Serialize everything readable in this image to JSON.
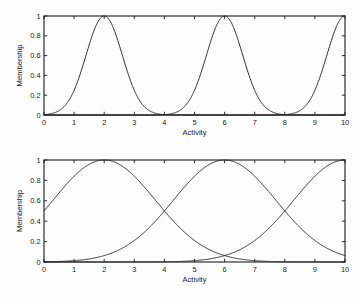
{
  "figure": {
    "background_color": "#fdfdfd",
    "axis_color": "#1a1a1a",
    "curve_color": "#2b2b2b",
    "panel_count": 2
  },
  "chart_data": [
    {
      "type": "line",
      "title": "",
      "subtitle": "",
      "panel": "top",
      "xlabel": "Activity",
      "ylabel": "Membership",
      "xlim": [
        0,
        10
      ],
      "ylim": [
        0,
        1
      ],
      "xticks": [
        0,
        1,
        2,
        3,
        4,
        5,
        6,
        7,
        8,
        9,
        10
      ],
      "xticklabels": [
        "0",
        "1",
        "2",
        "3",
        "4",
        "5",
        "6",
        "7",
        "8",
        "9",
        "10"
      ],
      "yticks": [
        0,
        0.2,
        0.4,
        0.6,
        0.8,
        1
      ],
      "yticklabels": [
        "0",
        "0.2",
        "0.4",
        "0.6",
        "0.8",
        "1"
      ],
      "grid": false,
      "legend": "none",
      "series": [
        {
          "name": "Low",
          "type": "gaussian",
          "center": 2,
          "sigma": 0.6,
          "peak": 1
        },
        {
          "name": "Medium",
          "type": "gaussian",
          "center": 6,
          "sigma": 0.6,
          "peak": 1
        },
        {
          "name": "High",
          "type": "gaussian",
          "center": 10,
          "sigma": 0.6,
          "peak": 1
        }
      ],
      "x": [
        0,
        0.5,
        1,
        1.5,
        2,
        2.5,
        3,
        3.5,
        4,
        4.5,
        5,
        5.5,
        6,
        6.5,
        7,
        7.5,
        8,
        8.5,
        9,
        9.5,
        10
      ],
      "y_low": [
        0.0,
        0.01,
        0.25,
        0.76,
        1.0,
        0.76,
        0.25,
        0.03,
        0.0,
        0.0,
        0.0,
        0.0,
        0.0,
        0.0,
        0.0,
        0.0,
        0.0,
        0.0,
        0.0,
        0.0,
        0.0
      ],
      "y_medium": [
        0.0,
        0.0,
        0.0,
        0.0,
        0.0,
        0.0,
        0.0,
        0.0,
        0.0,
        0.03,
        0.25,
        0.76,
        1.0,
        0.76,
        0.25,
        0.03,
        0.0,
        0.0,
        0.0,
        0.0,
        0.0
      ],
      "y_high": [
        0.0,
        0.0,
        0.0,
        0.0,
        0.0,
        0.0,
        0.0,
        0.0,
        0.0,
        0.0,
        0.0,
        0.0,
        0.0,
        0.0,
        0.0,
        0.0,
        0.0,
        0.03,
        0.25,
        0.76,
        1.0
      ]
    },
    {
      "type": "line",
      "title": "",
      "subtitle": "",
      "panel": "bottom",
      "xlabel": "Activity",
      "ylabel": "Membership",
      "xlim": [
        0,
        10
      ],
      "ylim": [
        0,
        1
      ],
      "xticks": [
        0,
        1,
        2,
        3,
        4,
        5,
        6,
        7,
        8,
        9,
        10
      ],
      "xticklabels": [
        "0",
        "1",
        "2",
        "3",
        "4",
        "5",
        "6",
        "7",
        "8",
        "9",
        "10"
      ],
      "yticks": [
        0,
        0.2,
        0.4,
        0.6,
        0.8,
        1
      ],
      "yticklabels": [
        "0",
        "0.2",
        "0.4",
        "0.6",
        "0.8",
        "1"
      ],
      "grid": false,
      "legend": "none",
      "series": [
        {
          "name": "Low",
          "type": "gaussian",
          "center": 2,
          "sigma": 1.7,
          "peak": 1
        },
        {
          "name": "Medium",
          "type": "gaussian",
          "center": 6,
          "sigma": 1.7,
          "peak": 1
        },
        {
          "name": "High",
          "type": "gaussian",
          "center": 10,
          "sigma": 1.7,
          "peak": 1
        }
      ],
      "x": [
        0,
        0.5,
        1,
        1.5,
        2,
        2.5,
        3,
        3.5,
        4,
        4.5,
        5,
        5.5,
        6,
        6.5,
        7,
        7.5,
        8,
        8.5,
        9,
        9.5,
        10
      ],
      "y_low": [
        0.25,
        0.44,
        0.65,
        0.87,
        1.0,
        0.87,
        0.65,
        0.44,
        0.25,
        0.12,
        0.05,
        0.01,
        0.0,
        0.0,
        0.0,
        0.0,
        0.0,
        0.0,
        0.0,
        0.0,
        0.0
      ],
      "y_medium": [
        0.0,
        0.0,
        0.0,
        0.01,
        0.05,
        0.12,
        0.25,
        0.44,
        0.65,
        0.87,
        1.0,
        0.87,
        0.65,
        0.44,
        0.25,
        0.12,
        0.05,
        0.01,
        0.0,
        0.0,
        0.0
      ],
      "y_high": [
        0.0,
        0.0,
        0.0,
        0.0,
        0.0,
        0.0,
        0.0,
        0.0,
        0.0,
        0.01,
        0.05,
        0.12,
        0.25,
        0.44,
        0.65,
        0.87,
        1.0,
        0.87,
        0.65,
        0.44,
        0.25
      ]
    }
  ]
}
